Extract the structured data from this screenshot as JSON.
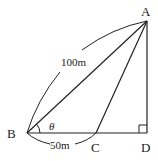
{
  "diagram": {
    "points": {
      "A": {
        "label": "A",
        "x": 147,
        "y": 21
      },
      "B": {
        "label": "B",
        "x": 27,
        "y": 133
      },
      "C": {
        "label": "C",
        "x": 96,
        "y": 133
      },
      "D": {
        "label": "D",
        "x": 147,
        "y": 133
      }
    },
    "segments": [
      "AB",
      "AC",
      "AD",
      "BD"
    ],
    "measurements": {
      "AB": "100m",
      "BC": "50m"
    },
    "angle_label": "θ",
    "right_angle_at": "D",
    "colors": {
      "stroke": "#222222",
      "background": "#ffffff"
    }
  }
}
